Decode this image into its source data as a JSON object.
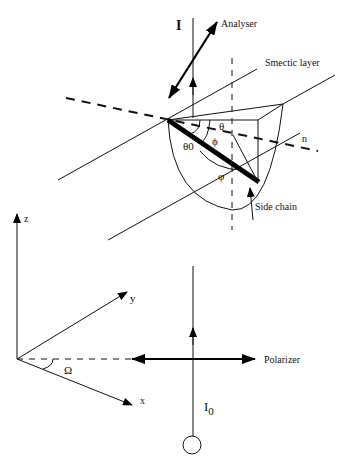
{
  "figure": {
    "labels": {
      "intensity_out": "I",
      "analyser": "Analyser",
      "smectic_layer": "Smectic layer",
      "theta": "θ",
      "phi_upper": "ϕ",
      "theta0": "θ0",
      "varphi": "φ",
      "director": "n",
      "side_chain": "Side chain",
      "axis_z": "z",
      "axis_y": "y",
      "axis_x": "x",
      "omega": "Ω",
      "polarizer": "Polarizer",
      "intensity_in_base": "I",
      "intensity_in_sub": "0"
    }
  }
}
